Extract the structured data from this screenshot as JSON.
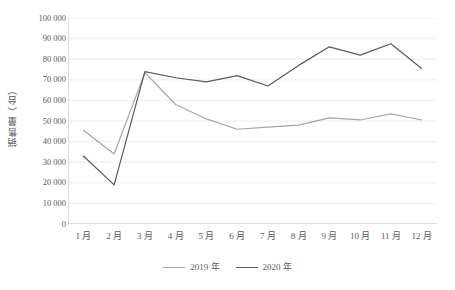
{
  "chart_data": {
    "type": "line",
    "title": "",
    "xlabel": "",
    "ylabel": "销售量（台）",
    "categories": [
      "1 月",
      "2 月",
      "3 月",
      "4 月",
      "5 月",
      "6 月",
      "7 月",
      "8 月",
      "9 月",
      "10 月",
      "11 月",
      "12 月"
    ],
    "ylim": [
      0,
      100000
    ],
    "ytick_step": 10000,
    "ytick_labels": [
      "100 000",
      "90 000",
      "80 000",
      "70 000",
      "60 000",
      "50 000",
      "40 000",
      "30 000",
      "20 000",
      "10 000",
      "0"
    ],
    "ytick_values": [
      100000,
      90000,
      80000,
      70000,
      60000,
      50000,
      40000,
      30000,
      20000,
      10000,
      0
    ],
    "grid": true,
    "grid_axis": "y",
    "legend_position": "bottom",
    "series": [
      {
        "name": "2019 年",
        "color": "#a6a6a6",
        "values": [
          45500,
          34000,
          73500,
          58000,
          51000,
          46000,
          47000,
          48000,
          51500,
          50500,
          53500,
          50500
        ]
      },
      {
        "name": "2020 年",
        "color": "#595959",
        "values": [
          33000,
          19000,
          74000,
          71000,
          69000,
          72000,
          67000,
          77000,
          86000,
          82000,
          87500,
          75500
        ]
      }
    ]
  },
  "colors": {
    "series_2019": "#a6a6a6",
    "series_2020": "#595959",
    "gridline": "#e8e8e8",
    "axis": "#b0b0b0",
    "text": "#5a5a5a",
    "background": "#ffffff"
  }
}
